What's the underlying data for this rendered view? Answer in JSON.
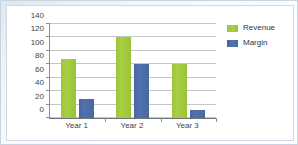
{
  "chart_data": {
    "type": "bar",
    "title": "",
    "xlabel": "",
    "ylabel": "",
    "categories": [
      "Year 1",
      "Year 2",
      "Year 3"
    ],
    "series": [
      {
        "name": "Revenue",
        "color": "#A2CB3A",
        "values": [
          88,
          120,
          80
        ]
      },
      {
        "name": "Margin",
        "color": "#4E6CAE",
        "values": [
          29,
          80,
          12
        ]
      }
    ],
    "ylim": [
      0,
      140
    ],
    "ytick_step": 20,
    "yticks": [
      0,
      20,
      40,
      60,
      80,
      100,
      120,
      140
    ],
    "ytick_labels": [
      "0",
      "20",
      "40",
      "60",
      "80",
      "100",
      "120",
      "140"
    ],
    "grid": true,
    "grid_axis": "y",
    "legend": true,
    "legend_position": "right",
    "legend_entries": [
      "Revenue",
      "Margin"
    ],
    "plot_background": "#FFFFFF",
    "gridline_color": "#C3C7CC",
    "axis_color": "#8A8F96",
    "frame_color": "#C9D4E2"
  }
}
